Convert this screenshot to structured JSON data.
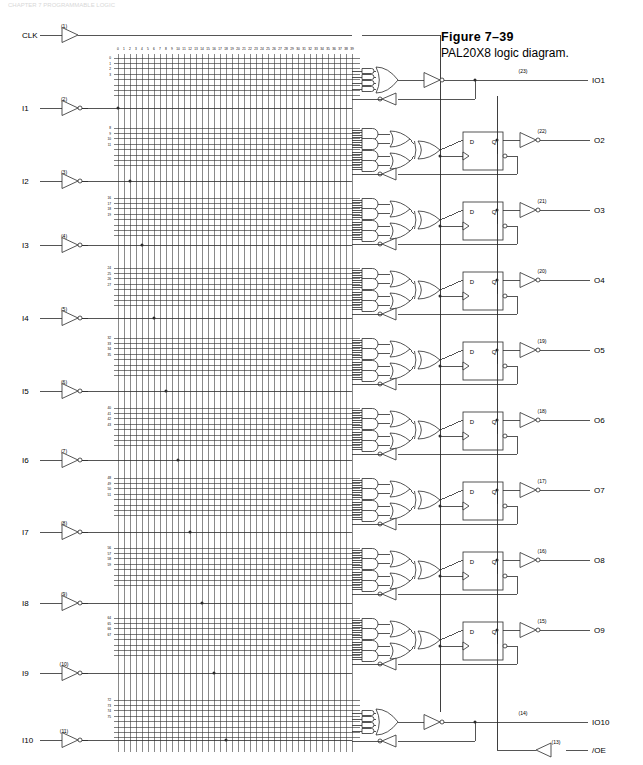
{
  "figure": {
    "number": "Figure  7–39",
    "caption": "PAL20X8 logic diagram.",
    "header_faint": "CHAPTER 7  PROGRAMMABLE LOGIC"
  },
  "device": {
    "name": "PAL20X8",
    "description": "logic diagram",
    "array_columns": 40,
    "array_rows": 80,
    "product_lines_per_output": 8
  },
  "column_labels": [
    "0",
    "1",
    "2",
    "3",
    "4",
    "5",
    "6",
    "7",
    "8",
    "9",
    "10",
    "11",
    "12",
    "13",
    "14",
    "15",
    "16",
    "17",
    "18",
    "19",
    "20",
    "21",
    "22",
    "23",
    "24",
    "25",
    "26",
    "27",
    "28",
    "29",
    "30",
    "31",
    "32",
    "33",
    "34",
    "35",
    "36",
    "37",
    "38",
    "39"
  ],
  "column_label_groups": [
    "0 1 2 3",
    "4 5 6 7",
    "8 9 10 11",
    "12 13 14 15",
    "16 17 18 19",
    "20 21 22 23",
    "24 25 26 27",
    "28 29 30 31",
    "32 33 34 35",
    "36 37 38 39"
  ],
  "inputs": [
    {
      "label": "CLK",
      "pin": "(1)",
      "pin_number": 1,
      "buffered": false,
      "inverting": false,
      "y": 35
    },
    {
      "label": "I1",
      "pin": "(2)",
      "pin_number": 2,
      "buffered": true,
      "inverting": true,
      "y": 108
    },
    {
      "label": "I2",
      "pin": "(3)",
      "pin_number": 3,
      "buffered": true,
      "inverting": true,
      "y": 181
    },
    {
      "label": "I3",
      "pin": "(4)",
      "pin_number": 4,
      "buffered": true,
      "inverting": true,
      "y": 245
    },
    {
      "label": "I4",
      "pin": "(5)",
      "pin_number": 5,
      "buffered": true,
      "inverting": true,
      "y": 318
    },
    {
      "label": "I5",
      "pin": "(6)",
      "pin_number": 6,
      "buffered": true,
      "inverting": true,
      "y": 391
    },
    {
      "label": "I6",
      "pin": "(7)",
      "pin_number": 7,
      "buffered": true,
      "inverting": true,
      "y": 460
    },
    {
      "label": "I7",
      "pin": "(8)",
      "pin_number": 8,
      "buffered": true,
      "inverting": true,
      "y": 532
    },
    {
      "label": "I8",
      "pin": "(9)",
      "pin_number": 9,
      "buffered": true,
      "inverting": true,
      "y": 603
    },
    {
      "label": "I9",
      "pin": "(10)",
      "pin_number": 10,
      "buffered": true,
      "inverting": true,
      "y": 673
    },
    {
      "label": "I10",
      "pin": "(11)",
      "pin_number": 11,
      "buffered": true,
      "inverting": true,
      "y": 740
    }
  ],
  "outputs": [
    {
      "label": "IO1",
      "pin": "(23)",
      "pin_number": 23,
      "type": "combinational",
      "has_flipflop": false,
      "y": 83
    },
    {
      "label": "O2",
      "pin": "(22)",
      "pin_number": 22,
      "type": "registered",
      "has_flipflop": true,
      "y": 150
    },
    {
      "label": "O3",
      "pin": "(21)",
      "pin_number": 21,
      "type": "registered",
      "has_flipflop": true,
      "y": 220
    },
    {
      "label": "O4",
      "pin": "(20)",
      "pin_number": 20,
      "type": "registered",
      "has_flipflop": true,
      "y": 290
    },
    {
      "label": "O5",
      "pin": "(19)",
      "pin_number": 19,
      "type": "registered",
      "has_flipflop": true,
      "y": 360
    },
    {
      "label": "O6",
      "pin": "(18)",
      "pin_number": 18,
      "type": "registered",
      "has_flipflop": true,
      "y": 430
    },
    {
      "label": "O7",
      "pin": "(17)",
      "pin_number": 17,
      "type": "registered",
      "has_flipflop": true,
      "y": 500
    },
    {
      "label": "O8",
      "pin": "(16)",
      "pin_number": 16,
      "type": "registered",
      "has_flipflop": true,
      "y": 570
    },
    {
      "label": "O9",
      "pin": "(15)",
      "pin_number": 15,
      "type": "registered",
      "has_flipflop": true,
      "y": 640
    },
    {
      "label": "IO10",
      "pin": "(14)",
      "pin_number": 14,
      "type": "combinational",
      "has_flipflop": false,
      "y": 725
    },
    {
      "label": "/OE",
      "pin": "(13)",
      "pin_number": 13,
      "type": "control",
      "has_flipflop": false,
      "y": 750
    }
  ],
  "row_groups": [
    {
      "labels": [
        "0",
        "1",
        "2",
        "3"
      ],
      "y": 58
    },
    {
      "labels": [
        "8",
        "9",
        "10",
        "11"
      ],
      "y": 128
    },
    {
      "labels": [
        "16",
        "17",
        "18",
        "19"
      ],
      "y": 198
    },
    {
      "labels": [
        "24",
        "25",
        "26",
        "27"
      ],
      "y": 268
    },
    {
      "labels": [
        "32",
        "33",
        "34",
        "35"
      ],
      "y": 338
    },
    {
      "labels": [
        "40",
        "41",
        "42",
        "43"
      ],
      "y": 408
    },
    {
      "labels": [
        "48",
        "49",
        "50",
        "51"
      ],
      "y": 478
    },
    {
      "labels": [
        "56",
        "57",
        "58",
        "59"
      ],
      "y": 548
    },
    {
      "labels": [
        "64",
        "65",
        "66",
        "67"
      ],
      "y": 618
    },
    {
      "labels": [
        "72",
        "73",
        "74",
        "75"
      ],
      "y": 700
    }
  ],
  "flipflop": {
    "input_label": "D",
    "output_label": "Q",
    "clock": "edge-triggered"
  },
  "colors": {
    "line": "#2a2a2a",
    "text": "#000000",
    "background": "#ffffff",
    "faint": "#d8d8d8"
  }
}
